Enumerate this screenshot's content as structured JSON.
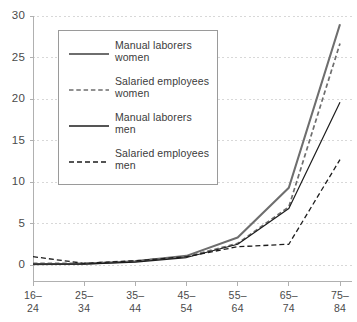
{
  "chart_data": {
    "type": "line",
    "title": "",
    "xlabel": "",
    "ylabel": "",
    "ylim": [
      0,
      30
    ],
    "yticks": [
      0,
      5,
      10,
      15,
      20,
      25,
      30
    ],
    "grid": true,
    "legend_position": "upper-left-inside",
    "categories": [
      "16–\n24",
      "25–\n34",
      "35–\n44",
      "45–\n54",
      "55–\n64",
      "65–\n74",
      "75–\n84"
    ],
    "category_labels": [
      {
        "line1": "16–",
        "line2": "24"
      },
      {
        "line1": "25–",
        "line2": "34"
      },
      {
        "line1": "35–",
        "line2": "44"
      },
      {
        "line1": "45–",
        "line2": "54"
      },
      {
        "line1": "55–",
        "line2": "64"
      },
      {
        "line1": "65–",
        "line2": "74"
      },
      {
        "line1": "75–",
        "line2": "84"
      }
    ],
    "series": [
      {
        "name": "Manual laborers women",
        "label_line1": "Manual laborers",
        "label_line2": "women",
        "style": "solid",
        "color": "#6e6e6e",
        "width": 2.1,
        "values": [
          0.1,
          0.15,
          0.45,
          1.1,
          3.3,
          9.3,
          29.0
        ]
      },
      {
        "name": "Salaried employees women",
        "label_line1": "Salaried employees",
        "label_line2": "women",
        "style": "dashed",
        "color": "#6e6e6e",
        "width": 1.7,
        "values": [
          0.2,
          0.2,
          0.5,
          1.0,
          2.6,
          7.0,
          26.7
        ]
      },
      {
        "name": "Manual laborers men",
        "label_line1": "Manual laborers",
        "label_line2": "men",
        "style": "solid",
        "color": "#1d1d1d",
        "width": 1.2,
        "values": [
          0.1,
          0.1,
          0.35,
          0.9,
          2.5,
          6.8,
          19.6
        ]
      },
      {
        "name": "Salaried employees men",
        "label_line1": "Salaried employees",
        "label_line2": "men",
        "style": "dashed",
        "color": "#1d1d1d",
        "width": 1.3,
        "values": [
          1.0,
          0.2,
          0.5,
          1.0,
          2.2,
          2.5,
          12.7
        ]
      }
    ]
  },
  "axis": {
    "y_tick_labels": [
      "30",
      "25",
      "20",
      "15",
      "10",
      "5",
      "0"
    ]
  },
  "caption": {
    "text": ""
  },
  "colors": {
    "gridline": "#d8d8d8",
    "axis": "#b0b0b0",
    "gray_series": "#6e6e6e",
    "black_series": "#1d1d1d",
    "legend_border": "#9a9a9a"
  }
}
